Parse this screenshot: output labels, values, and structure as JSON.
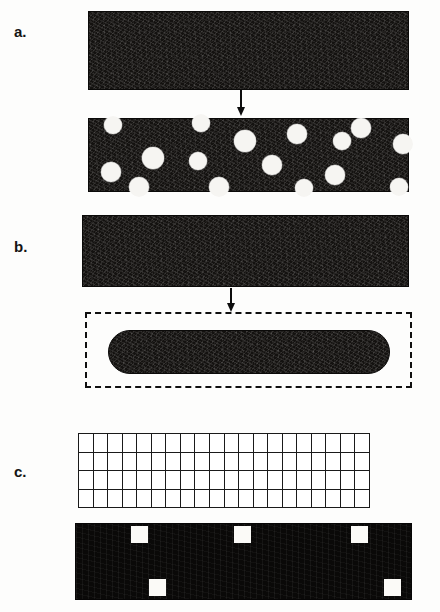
{
  "figure": {
    "background_color": "#fdfdfc",
    "ink_color": "#141210",
    "pore_color": "#f6f5f2",
    "outline_color": "#101010",
    "width": 440,
    "height": 612
  },
  "panels": [
    {
      "id": "a",
      "label": "a.",
      "label_x": 14,
      "label_y": 24,
      "description": "Dense bar transforms into a porous bar containing dispersed spherical pores",
      "before": {
        "name": "dense-bar",
        "x": 88,
        "y": 11,
        "w": 319,
        "h": 77,
        "fill": "#141210"
      },
      "arrow": {
        "x": 236,
        "y": 90,
        "w": 10,
        "h": 26
      },
      "after": {
        "name": "porous-bar",
        "x": 88,
        "y": 118,
        "w": 319,
        "h": 72,
        "fill": "#141210",
        "pores": [
          {
            "cx": 112,
            "cy": 124,
            "r": 9
          },
          {
            "cx": 200,
            "cy": 122,
            "r": 9
          },
          {
            "cx": 244,
            "cy": 140,
            "r": 11
          },
          {
            "cx": 152,
            "cy": 157,
            "r": 11
          },
          {
            "cx": 110,
            "cy": 171,
            "r": 10
          },
          {
            "cx": 197,
            "cy": 160,
            "r": 9
          },
          {
            "cx": 296,
            "cy": 133,
            "r": 10
          },
          {
            "cx": 341,
            "cy": 140,
            "r": 9
          },
          {
            "cx": 402,
            "cy": 143,
            "r": 10
          },
          {
            "cx": 360,
            "cy": 127,
            "r": 10
          },
          {
            "cx": 271,
            "cy": 164,
            "r": 10
          },
          {
            "cx": 334,
            "cy": 174,
            "r": 10
          },
          {
            "cx": 138,
            "cy": 186,
            "r": 10
          },
          {
            "cx": 218,
            "cy": 186,
            "r": 10
          },
          {
            "cx": 303,
            "cy": 187,
            "r": 9
          },
          {
            "cx": 398,
            "cy": 186,
            "r": 9
          }
        ]
      }
    },
    {
      "id": "b",
      "label": "b.",
      "label_x": 14,
      "label_y": 239,
      "description": "Dense bar shrinks and spheroidises into a rounded particle inside the original outline",
      "before": {
        "name": "dense-bar",
        "x": 82,
        "y": 215,
        "w": 325,
        "h": 70,
        "fill": "#141210"
      },
      "arrow": {
        "x": 226,
        "y": 288,
        "w": 10,
        "h": 24
      },
      "outline": {
        "name": "original-outline",
        "x": 85,
        "y": 312,
        "w": 327,
        "h": 76,
        "style": "dashed"
      },
      "after": {
        "name": "spheroidised-particle",
        "x": 108,
        "y": 330,
        "w": 280,
        "h": 42,
        "fill": "#141210",
        "shape": "pill"
      }
    },
    {
      "id": "c",
      "label": "c.",
      "label_x": 14,
      "label_y": 464,
      "description": "Lattice grid of cells and the corresponding filled bar with isolated empty cells (vacancies)",
      "grid": {
        "name": "lattice-grid",
        "x": 78,
        "y": 433,
        "w": 292,
        "h": 75,
        "rows": 4,
        "cols": 20,
        "line_color": "#1a1a1a",
        "cell_fill": "#ffffff"
      },
      "bar": {
        "name": "filled-lattice-bar",
        "x": 75,
        "y": 523,
        "w": 335,
        "h": 75,
        "fill": "#0a0908",
        "vacancies": [
          {
            "x": 130,
            "y": 525,
            "w": 17,
            "h": 17
          },
          {
            "x": 233,
            "y": 525,
            "w": 17,
            "h": 17
          },
          {
            "x": 350,
            "y": 525,
            "w": 17,
            "h": 17
          },
          {
            "x": 148,
            "y": 578,
            "w": 17,
            "h": 17
          },
          {
            "x": 383,
            "y": 578,
            "w": 17,
            "h": 17
          }
        ]
      }
    }
  ]
}
